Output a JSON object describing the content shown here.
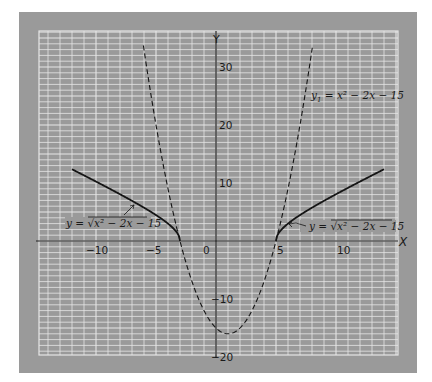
{
  "chart_data": {
    "type": "line",
    "title": "",
    "xlabel": "X",
    "ylabel": "Y",
    "xlim": [
      -14.75,
      15.2
    ],
    "ylim": [
      -19.7,
      36.2
    ],
    "grid": true,
    "grid_step": {
      "x": 1,
      "y": 1
    },
    "x_ticks": [
      {
        "value": -10,
        "label": "−10"
      },
      {
        "value": -5,
        "label": "−5"
      },
      {
        "value": 0,
        "label": "0"
      },
      {
        "value": 5,
        "label": "5"
      },
      {
        "value": 10,
        "label": "10"
      }
    ],
    "y_ticks": [
      {
        "value": 30,
        "label": "30"
      },
      {
        "value": 20,
        "label": "20"
      },
      {
        "value": 10,
        "label": "10"
      },
      {
        "value": -10,
        "label": "−10"
      },
      {
        "value": -20,
        "label": "−20"
      }
    ],
    "series": [
      {
        "name": "y1 = x^2 - 2x - 15",
        "style": "dashed",
        "formula": "x^2 - 2x - 15",
        "x_range": [
          -6.05,
          8.05
        ],
        "x": [
          -6,
          -5,
          -4,
          -3,
          -2,
          -1,
          0,
          1,
          2,
          3,
          4,
          5,
          6,
          7,
          8
        ],
        "values": [
          33,
          20,
          9,
          0,
          -7,
          -12,
          -15,
          -16,
          -15,
          -12,
          -7,
          0,
          9,
          20,
          33
        ]
      },
      {
        "name": "y = sqrt(x^2 - 2x - 15) (left branch)",
        "style": "solid",
        "formula": "sqrt(x^2 - 2x - 15)",
        "x_range": [
          -12,
          -3
        ],
        "x": [
          -12,
          -11,
          -10,
          -9,
          -8,
          -7,
          -6,
          -5,
          -4,
          -3
        ],
        "values": [
          12.37,
          11.31,
          10.25,
          9.17,
          8.06,
          6.93,
          5.74,
          4.47,
          3.0,
          0
        ]
      },
      {
        "name": "y = sqrt(x^2 - 2x - 15) (right branch)",
        "style": "solid",
        "formula": "sqrt(x^2 - 2x - 15)",
        "x_range": [
          5,
          14
        ],
        "x": [
          5,
          6,
          7,
          8,
          9,
          10,
          11,
          12,
          13,
          14
        ],
        "values": [
          0,
          3.0,
          4.47,
          5.74,
          6.93,
          8.06,
          9.17,
          10.25,
          11.31,
          12.37
        ]
      }
    ],
    "annotations": [
      {
        "text_main": "y",
        "text_sub": "1",
        "text_rest": " = x² − 2x − 15",
        "target": "dashed parabola"
      },
      {
        "text_left": "y = √",
        "text_rad": "x² − 2x − 15",
        "target": "left solid branch"
      },
      {
        "text_left": "y = √",
        "text_rad": "x² − 2x − 15",
        "target": "right solid branch"
      }
    ]
  },
  "colors": {
    "panel": "#9a9a9a",
    "grid_line": "#e6e6e6",
    "axis": "#1e1e1e",
    "curve": "#151515",
    "background": "#ffffff"
  }
}
